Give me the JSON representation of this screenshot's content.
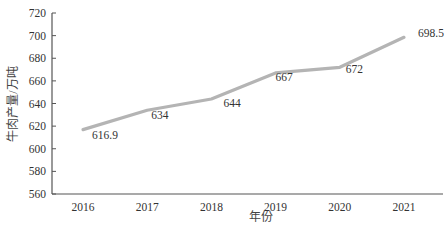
{
  "chart_data": {
    "type": "line",
    "title": "",
    "xlabel": "年份",
    "ylabel": "牛肉产量/万吨",
    "categories": [
      "2016",
      "2017",
      "2018",
      "2019",
      "2020",
      "2021"
    ],
    "series": [
      {
        "name": "牛肉产量",
        "values": [
          616.9,
          634,
          644,
          667,
          672,
          698.5
        ],
        "labels": [
          "616.9",
          "634",
          "644",
          "667",
          "672",
          "698.5"
        ]
      }
    ],
    "ylim": [
      560,
      720
    ],
    "yticks": [
      560,
      580,
      600,
      620,
      640,
      660,
      680,
      700,
      720
    ],
    "grid": false,
    "legend": "none",
    "line_color": "#b4b4b4",
    "axis_color": "#555555"
  }
}
